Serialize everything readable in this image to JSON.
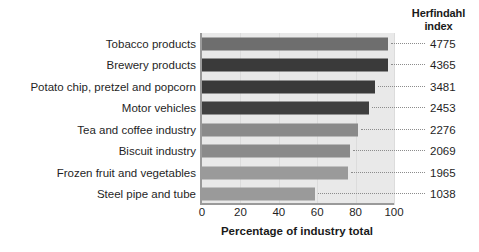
{
  "chart_data": {
    "type": "bar",
    "orientation": "horizontal",
    "title": "",
    "xlabel": "Percentage of industry total",
    "ylabel": "",
    "xlim": [
      0,
      100
    ],
    "xticks": [
      0,
      20,
      40,
      60,
      80,
      100
    ],
    "grid": true,
    "legend": null,
    "categories": [
      "Tobacco products",
      "Brewery products",
      "Potato chip, pretzel and popcorn",
      "Motor vehicles",
      "Tea and coffee industry",
      "Biscuit industry",
      "Frozen fruit and vegetables",
      "Steel pipe and tube"
    ],
    "values": [
      97,
      97,
      90,
      87,
      81,
      77,
      76,
      59
    ],
    "secondary_column": {
      "header_lines": [
        "Herfindahl",
        "index"
      ],
      "values": [
        4775,
        4365,
        3481,
        2453,
        2276,
        2069,
        1965,
        1038
      ]
    },
    "bar_colors": [
      "#6e6e6e",
      "#3a3a3a",
      "#3a3a3a",
      "#3f3f3f",
      "#8a8a8a",
      "#8a8a8a",
      "#9a9a9a",
      "#9a9a9a"
    ],
    "plot_background": "#e9e9e9",
    "axis_color": "#9a9a9a"
  },
  "axis": {
    "x_title": "Percentage of industry total",
    "tick_labels": [
      "0",
      "20",
      "40",
      "60",
      "80",
      "100"
    ]
  },
  "index_column": {
    "header_line1": "Herfindahl",
    "header_line2": "index"
  },
  "rows": [
    {
      "category": "Tobacco products",
      "value": 97,
      "index": "4775"
    },
    {
      "category": "Brewery products",
      "value": 97,
      "index": "4365"
    },
    {
      "category": "Potato chip, pretzel and popcorn",
      "value": 90,
      "index": "3481"
    },
    {
      "category": "Motor vehicles",
      "value": 87,
      "index": "2453"
    },
    {
      "category": "Tea and coffee industry",
      "value": 81,
      "index": "2276"
    },
    {
      "category": "Biscuit industry",
      "value": 77,
      "index": "2069"
    },
    {
      "category": "Frozen fruit and vegetables",
      "value": 76,
      "index": "1965"
    },
    {
      "category": "Steel pipe and tube",
      "value": 59,
      "index": "1038"
    }
  ]
}
